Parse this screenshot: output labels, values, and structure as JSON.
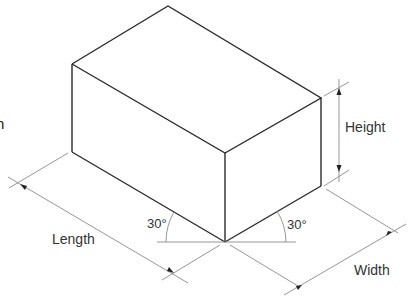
{
  "diagram": {
    "type": "isometric-box-dimensions",
    "colors": {
      "edges": "#2a2a2a",
      "dimension_lines": "#8a8a8a",
      "text": "#333333",
      "background": "#ffffff"
    },
    "labels": {
      "height": "Height",
      "length": "Length",
      "width": "Width",
      "angle_left": "30°",
      "angle_right": "30°",
      "clipped_left_text": "h"
    }
  }
}
